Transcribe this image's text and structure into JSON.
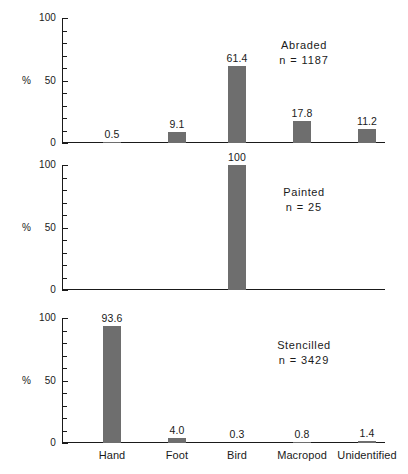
{
  "chart_data": {
    "type": "bar",
    "title": "",
    "xlabel": "",
    "ylabel": "%",
    "ylim": [
      0,
      100
    ],
    "yticks": [
      0,
      50,
      100
    ],
    "ytick_labels": [
      "0",
      "50",
      "100"
    ],
    "minor_tick_step": 10,
    "grid": false,
    "legend": "none",
    "categories": [
      "Hand",
      "Foot",
      "Bird",
      "Macropod",
      "Unidentified"
    ],
    "panels": [
      {
        "name": "Abraded",
        "n_label": "n = 1187",
        "n": 1187,
        "values": [
          0.5,
          9.1,
          61.4,
          17.8,
          11.2
        ],
        "value_labels": [
          "0.5",
          "9.1",
          "61.4",
          "17.8",
          "11.2"
        ]
      },
      {
        "name": "Painted",
        "n_label": "n = 25",
        "n": 25,
        "values": [
          0,
          0,
          100,
          0,
          0
        ],
        "value_labels": [
          "",
          "",
          "100",
          "",
          ""
        ]
      },
      {
        "name": "Stencilled",
        "n_label": "n = 3429",
        "n": 3429,
        "values": [
          93.6,
          4.0,
          0.3,
          0.8,
          1.4
        ],
        "value_labels": [
          "93.6",
          "4.0",
          "0.3",
          "0.8",
          "1.4"
        ]
      }
    ],
    "colors": {
      "bar": "#6e6e6e",
      "axis": "#1a1a1a",
      "text": "#1a1a1a",
      "background": "#ffffff"
    }
  }
}
